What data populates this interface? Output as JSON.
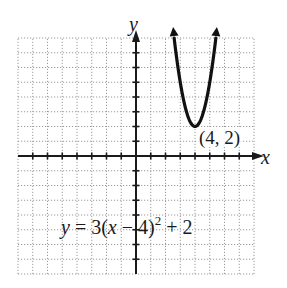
{
  "chart_data": {
    "type": "line",
    "title": "",
    "xlabel": "x",
    "ylabel": "y",
    "xlim": [
      -8,
      8
    ],
    "ylim": [
      -8,
      8
    ],
    "grid": true,
    "grid_step": 1,
    "function": "y = 3(x - 4)^2 + 2",
    "series": [
      {
        "name": "y = 3(x - 4)^2 + 2",
        "x": [
          2.59,
          3.0,
          3.5,
          4.0,
          4.5,
          5.0,
          5.41
        ],
        "y": [
          8.0,
          5.0,
          2.75,
          2.0,
          2.75,
          5.0,
          8.0
        ]
      }
    ],
    "annotations": [
      {
        "text": "(4, 2)",
        "x": 4,
        "y": 2,
        "label": "vertex"
      },
      {
        "text": "y = 3(x − 4)² + 2",
        "label": "equation"
      }
    ]
  },
  "labels": {
    "x_axis": "x",
    "y_axis": "y",
    "vertex": "(4, 2)",
    "eq_y": "y",
    "eq_mid": " = 3(",
    "eq_x": "x",
    "eq_rest": " − 4)",
    "eq_exp": "2",
    "eq_tail": " + 2"
  },
  "colors": {
    "grid": "#9a9a9a",
    "axis": "#1a1a1a",
    "curve": "#111111"
  }
}
